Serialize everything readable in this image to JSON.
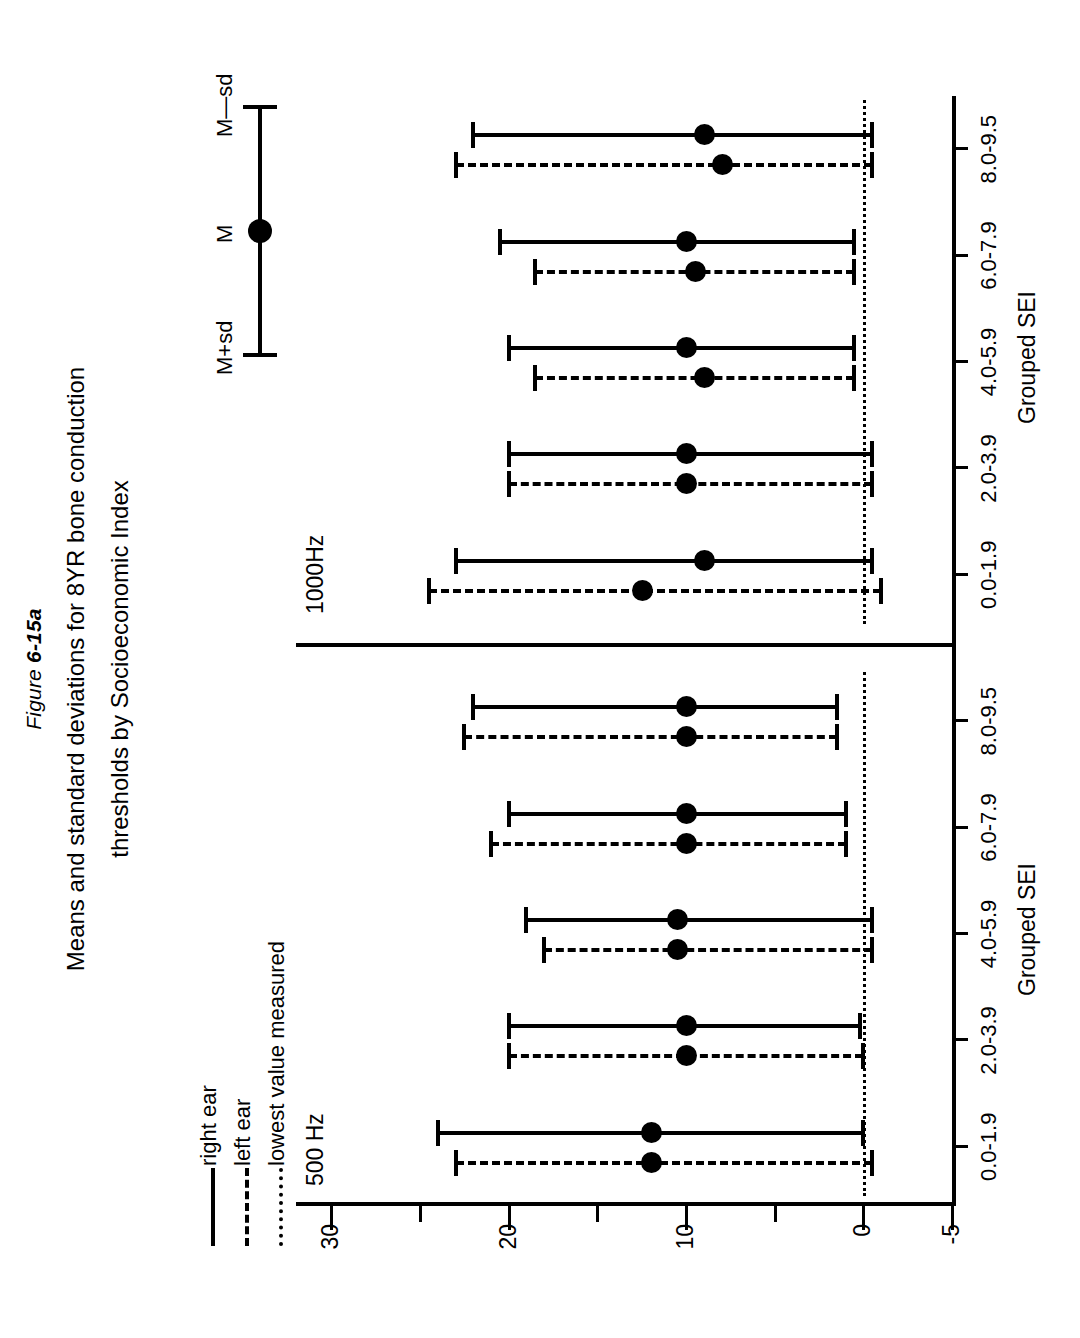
{
  "figure": {
    "number_prefix": "Figure ",
    "number": "6-15a",
    "title_line1": "Means and standard deviations for 8YR bone conduction",
    "title_line2": "thresholds by Socioeconomic Index"
  },
  "key": {
    "upper_label": "M+sd",
    "mean_label": "M",
    "lower_label": "M—sd"
  },
  "legend": {
    "items": [
      {
        "label": "right ear",
        "style": "solid"
      },
      {
        "label": "left ear",
        "style": "dashed"
      },
      {
        "label": "lowest value measured",
        "style": "dotted"
      }
    ]
  },
  "axes": {
    "y_title": "MEAN  HL  in  dB  re  ISO  1964",
    "y_ticks": [
      "30",
      "20",
      "10",
      "0",
      "-5"
    ],
    "y_tick_values": [
      30,
      20,
      10,
      0,
      -5
    ],
    "y_minor_values": [
      25,
      15,
      5
    ],
    "y_limits": [
      -5,
      32
    ],
    "x_title": "Grouped SEI",
    "x_categories": [
      "0.0-1.9",
      "2.0-3.9",
      "4.0-5.9",
      "6.0-7.9",
      "8.0-9.5"
    ],
    "zero_reference": 0
  },
  "panels": [
    {
      "id": "p500",
      "frequency_label": "500 Hz"
    },
    {
      "id": "p1000",
      "frequency_label": "1000Hz"
    }
  ],
  "chart_data": {
    "type": "scatter",
    "title": "Means and standard deviations for 8YR bone conduction thresholds by Socioeconomic Index",
    "subtitle": "Figure 6-15a",
    "xlabel": "Grouped SEI",
    "ylabel": "MEAN  HL  in  dB  re  ISO  1964",
    "ylim": [
      -5,
      32
    ],
    "grid": false,
    "legend_position": "upper-left",
    "categories": [
      "0.0-1.9",
      "2.0-3.9",
      "4.0-5.9",
      "6.0-7.9",
      "8.0-9.5"
    ],
    "panels": [
      {
        "name": "500 Hz",
        "series": [
          {
            "name": "right ear",
            "style": "solid",
            "mean": [
              12.0,
              10.0,
              10.5,
              10.0,
              10.0
            ],
            "lower": [
              0.0,
              0.2,
              -0.5,
              1.0,
              1.5
            ],
            "upper": [
              24.0,
              20.0,
              19.0,
              20.0,
              22.0
            ]
          },
          {
            "name": "left ear",
            "style": "dashed",
            "mean": [
              12.0,
              10.0,
              10.5,
              10.0,
              10.0
            ],
            "lower": [
              -0.5,
              0.0,
              -0.5,
              1.0,
              1.5
            ],
            "upper": [
              23.0,
              20.0,
              18.0,
              21.0,
              22.5
            ]
          }
        ]
      },
      {
        "name": "1000Hz",
        "series": [
          {
            "name": "right ear",
            "style": "solid",
            "mean": [
              9.0,
              10.0,
              10.0,
              10.0,
              9.0
            ],
            "lower": [
              -0.5,
              -0.5,
              0.5,
              0.5,
              -0.5
            ],
            "upper": [
              23.0,
              20.0,
              20.0,
              20.5,
              22.0
            ]
          },
          {
            "name": "left ear",
            "style": "dashed",
            "mean": [
              12.5,
              10.0,
              9.0,
              9.5,
              8.0
            ],
            "lower": [
              -1.0,
              -0.5,
              0.5,
              0.5,
              -0.5
            ],
            "upper": [
              24.5,
              20.0,
              18.5,
              18.5,
              23.0
            ]
          }
        ]
      }
    ]
  }
}
